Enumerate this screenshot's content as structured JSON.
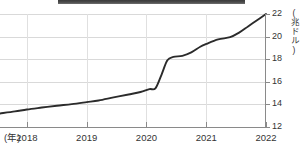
{
  "chart_data": {
    "type": "line",
    "title": "",
    "xlabel": "(年)",
    "ylabel": "(兆ドル)",
    "xlim": [
      2017.55,
      2022.0
    ],
    "ylim": [
      12,
      22
    ],
    "grid": true,
    "legend": false,
    "x_tick_labels": [
      "2018",
      "2019",
      "2020",
      "2021",
      "2022"
    ],
    "x_ticks": [
      2018,
      2019,
      2020,
      2021,
      2022
    ],
    "y_tick_labels": [
      "12",
      "14",
      "16",
      "18",
      "20",
      "22"
    ],
    "y_ticks": [
      12,
      14,
      16,
      18,
      20,
      22
    ],
    "series": [
      {
        "name": "マネーサプライ",
        "color": "#2b2b2b",
        "x": [
          2017.55,
          2017.8,
          2018.0,
          2018.25,
          2018.5,
          2018.75,
          2019.0,
          2019.2,
          2019.45,
          2019.7,
          2019.9,
          2020.05,
          2020.15,
          2020.25,
          2020.35,
          2020.45,
          2020.6,
          2020.75,
          2020.9,
          2021.0,
          2021.2,
          2021.4,
          2021.55,
          2021.7,
          2021.85,
          2022.0
        ],
        "values": [
          13.2,
          13.38,
          13.55,
          13.72,
          13.88,
          14.02,
          14.2,
          14.35,
          14.62,
          14.88,
          15.1,
          15.35,
          15.42,
          16.6,
          17.9,
          18.2,
          18.3,
          18.6,
          19.1,
          19.35,
          19.75,
          19.95,
          20.35,
          20.9,
          21.45,
          22.0
        ]
      }
    ]
  }
}
